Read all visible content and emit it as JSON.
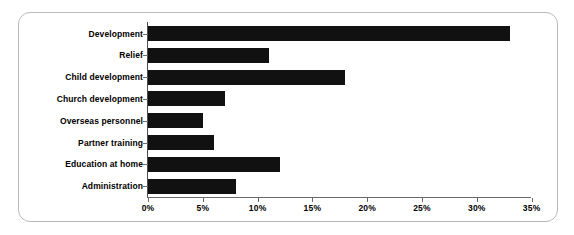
{
  "chart_data": {
    "type": "bar",
    "orientation": "horizontal",
    "title": "",
    "subtitle": "",
    "xlabel": "",
    "ylabel": "",
    "xlim": [
      0,
      35
    ],
    "ylim": null,
    "grid": false,
    "legend": null,
    "legend_position": "none",
    "axis_unit": "%",
    "bar_color": "#111111",
    "categories": [
      "Development",
      "Relief",
      "Child development",
      "Church development",
      "Overseas personnel",
      "Partner training",
      "Education at home",
      "Administration"
    ],
    "values": [
      33,
      11,
      18,
      7,
      5,
      6,
      12,
      8
    ],
    "xticks": [
      0,
      5,
      10,
      15,
      20,
      25,
      30,
      35
    ],
    "xtick_labels": [
      "0%",
      "5%",
      "10%",
      "15%",
      "20%",
      "25%",
      "30%",
      "35%"
    ]
  },
  "frame": {
    "border_color": "#b9b9b9",
    "background": "#ffffff"
  }
}
